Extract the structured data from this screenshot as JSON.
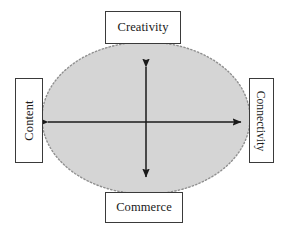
{
  "diagram": {
    "shape": {
      "name": "central-ellipse",
      "fill_color": "#d5d5d5",
      "border_color": "#8a8a8a",
      "border_style": "dotted",
      "cx": 146,
      "cy": 118,
      "rx": 104,
      "ry": 76
    },
    "nodes": [
      {
        "id": "creativity",
        "label": "Creativity",
        "position": "top",
        "orientation": "horizontal"
      },
      {
        "id": "content",
        "label": "Content",
        "position": "left",
        "orientation": "vertical-bottom-to-top"
      },
      {
        "id": "connectivity",
        "label": "Connectivity",
        "position": "right",
        "orientation": "vertical-top-to-bottom"
      },
      {
        "id": "commerce",
        "label": "Commerce",
        "position": "bottom",
        "orientation": "horizontal"
      }
    ],
    "arrows": [
      {
        "id": "horizontal-axis",
        "double_headed": true,
        "from": "content",
        "to": "connectivity",
        "x1": 47,
        "y1": 122,
        "x2": 242,
        "y2": 122,
        "color": "#1a1a1a"
      },
      {
        "id": "vertical-axis",
        "double_headed": true,
        "from": "creativity",
        "to": "commerce",
        "x1": 146,
        "y1": 66,
        "x2": 146,
        "y2": 178,
        "color": "#1a1a1a"
      }
    ],
    "colors": {
      "background": "#ffffff",
      "box_border": "#3a3a3a",
      "box_fill": "#ffffff",
      "text": "#1a1a1a",
      "arrow": "#1a1a1a"
    }
  }
}
